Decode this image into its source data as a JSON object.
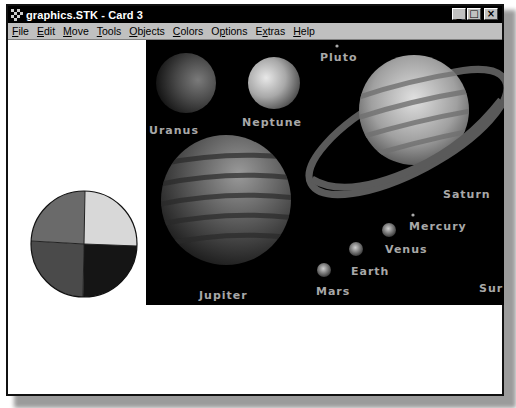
{
  "window": {
    "title": "graphics.STK - Card 3",
    "buttons": {
      "minimize": "_",
      "maximize": "□",
      "close": "×"
    }
  },
  "menu": {
    "items": [
      {
        "label": "File",
        "accel": "F",
        "rest": "ile"
      },
      {
        "label": "Edit",
        "accel": "E",
        "rest": "dit"
      },
      {
        "label": "Move",
        "accel": "M",
        "rest": "ove"
      },
      {
        "label": "Tools",
        "accel": "T",
        "rest": "ools"
      },
      {
        "label": "Objects",
        "accel": "O",
        "rest": "bjects"
      },
      {
        "label": "Colors",
        "accel": "C",
        "rest": "olors"
      },
      {
        "label": "Options",
        "accel": "p",
        "pre": "O",
        "rest": "tions"
      },
      {
        "label": "Extras",
        "accel": "x",
        "pre": "E",
        "rest": "tras"
      },
      {
        "label": "Help",
        "accel": "H",
        "rest": "elp"
      }
    ]
  },
  "solar_system_image": {
    "labels": {
      "pluto": "Pluto",
      "uranus": "Uranus",
      "neptune": "Neptune",
      "saturn": "Saturn",
      "jupiter": "Jupiter",
      "mercury": "Mercury",
      "venus": "Venus",
      "earth": "Earth",
      "mars": "Mars",
      "sun": "Sur"
    }
  },
  "pie_chart": {
    "slices": [
      {
        "name": "top-right",
        "color": "#d8d8d8",
        "percent": 25
      },
      {
        "name": "bottom-right",
        "color": "#151515",
        "percent": 25
      },
      {
        "name": "bottom-left",
        "color": "#4a4a4a",
        "percent": 25
      },
      {
        "name": "top-left",
        "color": "#6a6a6a",
        "percent": 25
      }
    ]
  },
  "colors": {
    "titlebar": "#000000",
    "menubar": "#c0c0c0",
    "canvas": "#ffffff",
    "space": "#000000",
    "label": "#a8a8a8"
  }
}
